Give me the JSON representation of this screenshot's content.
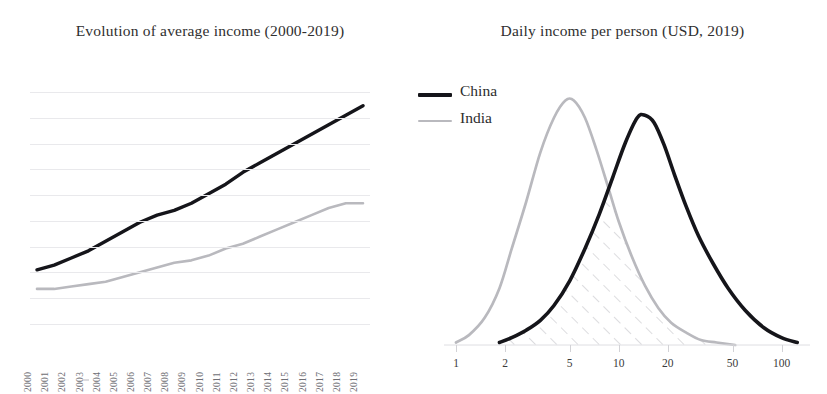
{
  "figure": {
    "background": "#ffffff",
    "colors": {
      "china_line": "#15151a",
      "india_line": "#b9b9be",
      "gridline": "#e9e9ec",
      "axis": "#dedee2",
      "hatch": "#c9c9ce",
      "text": "#2b2b2b",
      "tick_text_left": "#6e6e74",
      "tick_text_right": "#3b3b3b"
    }
  },
  "panels": {
    "left": {
      "title": "Evolution of average income (2000-2019)",
      "grid": true,
      "gridline_count": 10,
      "xtick_labels": [
        "2000",
        "2001",
        "2002",
        "2003",
        "2004",
        "2005",
        "2006",
        "2007",
        "2008",
        "2009",
        "2010",
        "2011",
        "2012",
        "2013",
        "2014",
        "2015",
        "2016",
        "2017",
        "2018",
        "2019"
      ]
    },
    "right": {
      "title": "Daily income per person (USD, 2019)",
      "legend": {
        "position": "top-left",
        "entries": [
          {
            "label": "China",
            "style": "thick-solid",
            "color": "#15151a"
          },
          {
            "label": "India",
            "style": "thin-solid",
            "color": "#b9b9be"
          }
        ]
      },
      "xtick_labels": [
        "1",
        "2",
        "5",
        "10",
        "20",
        "50",
        "100"
      ],
      "x_scale": "log",
      "overlap_shading": "diagonal-hatch"
    }
  },
  "chart_data": [
    {
      "type": "line",
      "title": "Evolution of average income (2000-2019)",
      "xlabel": "",
      "ylabel": "",
      "grid": true,
      "legend": null,
      "categories": [
        "2000",
        "2001",
        "2002",
        "2003",
        "2004",
        "2005",
        "2006",
        "2007",
        "2008",
        "2009",
        "2010",
        "2011",
        "2012",
        "2013",
        "2014",
        "2015",
        "2016",
        "2017",
        "2018",
        "2019"
      ],
      "ylim": [
        0,
        100
      ],
      "series": [
        {
          "name": "China",
          "color": "#15151a",
          "values": [
            24,
            26,
            29,
            32,
            36,
            40,
            44,
            47,
            49,
            52,
            56,
            60,
            65,
            69,
            73,
            77,
            81,
            85,
            89,
            93
          ]
        },
        {
          "name": "India",
          "color": "#b9b9be",
          "values": [
            16,
            16,
            17,
            18,
            19,
            21,
            23,
            25,
            27,
            28,
            30,
            33,
            35,
            38,
            41,
            44,
            47,
            50,
            52,
            52
          ]
        }
      ]
    },
    {
      "type": "line",
      "title": "Daily income per person (USD, 2019)",
      "xlabel": "",
      "ylabel": "",
      "grid": false,
      "x_scale": "log",
      "xlim": [
        1,
        130
      ],
      "ylim": [
        0,
        100
      ],
      "legend_position": "top-left",
      "xticks": [
        1,
        2,
        5,
        10,
        20,
        50,
        100
      ],
      "xtick_labels": [
        "1",
        "2",
        "5",
        "10",
        "20",
        "50",
        "100"
      ],
      "annotations": [
        {
          "type": "hatched-region",
          "label": "overlap between China and India distributions",
          "x_from": 2,
          "x_to": 35
        }
      ],
      "series": [
        {
          "name": "China",
          "color": "#15151a",
          "peak_x": 14,
          "x": [
            1.85,
            2.2,
            2.7,
            3.3,
            4.0,
            5.0,
            6.2,
            7.6,
            9.2,
            11.0,
            13.0,
            14.5,
            16.5,
            19.0,
            22.0,
            26.0,
            31.0,
            38.0,
            47.0,
            60.0,
            78.0,
            100.0,
            125.0
          ],
          "values": [
            1,
            3,
            6,
            10,
            16,
            26,
            39,
            53,
            68,
            82,
            92,
            93,
            90,
            81,
            69,
            56,
            44,
            33,
            23,
            14,
            7,
            3,
            1
          ]
        },
        {
          "name": "India",
          "color": "#b9b9be",
          "peak_x": 5,
          "x": [
            1.0,
            1.2,
            1.5,
            1.85,
            2.2,
            2.7,
            3.3,
            4.0,
            4.7,
            5.3,
            6.2,
            7.3,
            8.6,
            10.0,
            12.0,
            14.5,
            17.5,
            21.0,
            26.0,
            32.0,
            40.0,
            52.0
          ],
          "values": [
            1,
            4,
            11,
            23,
            39,
            58,
            78,
            92,
            99,
            99,
            92,
            79,
            64,
            50,
            36,
            24,
            15,
            9,
            5,
            2,
            1,
            0
          ]
        }
      ]
    }
  ]
}
